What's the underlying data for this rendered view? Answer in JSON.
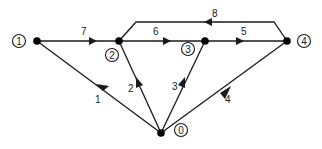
{
  "diagram": {
    "type": "directed-graph",
    "nodes": [
      {
        "id": "0",
        "label": "0",
        "x": 161,
        "y": 133,
        "lx": 181,
        "ly": 130
      },
      {
        "id": "1",
        "label": "1",
        "x": 37,
        "y": 41,
        "lx": 19,
        "ly": 41
      },
      {
        "id": "2",
        "label": "2",
        "x": 119,
        "y": 41,
        "lx": 112,
        "ly": 55
      },
      {
        "id": "3",
        "label": "3",
        "x": 205,
        "y": 41,
        "lx": 188,
        "ly": 49
      },
      {
        "id": "4",
        "label": "4",
        "x": 287,
        "y": 41,
        "lx": 304,
        "ly": 41
      }
    ],
    "edges": [
      {
        "id": "e1",
        "label": "1",
        "from": "0",
        "to": "1"
      },
      {
        "id": "e2",
        "label": "2",
        "from": "0",
        "to": "2"
      },
      {
        "id": "e3",
        "label": "3",
        "from": "0",
        "to": "3"
      },
      {
        "id": "e4",
        "label": "4",
        "from": "0",
        "to": "4"
      },
      {
        "id": "e5",
        "label": "5",
        "from": "3",
        "to": "4"
      },
      {
        "id": "e6",
        "label": "6",
        "from": "2",
        "to": "3"
      },
      {
        "id": "e7",
        "label": "7",
        "from": "1",
        "to": "2"
      },
      {
        "id": "e8",
        "label": "8",
        "from": "4",
        "to": "2"
      }
    ]
  }
}
